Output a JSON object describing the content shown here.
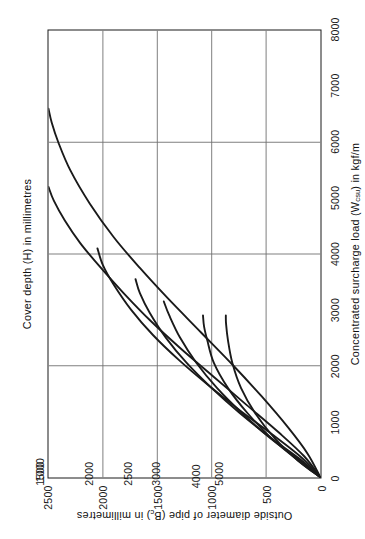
{
  "figure": {
    "caption": "Concentrated surcharge loading - fields, gardens and lightly trafficked access roads. Impact factor 2.0"
  },
  "chart_data": {
    "type": "line",
    "title": "Cover depth (H) in millimetres",
    "xlabel": "Concentrated surcharge load (Wcsu) in kgf/m",
    "xlabel_parts": {
      "pre": "Concentrated surcharge load (W",
      "sub": "csu",
      "post": ") in kgf/m"
    },
    "ylabel": "Outside diameter of pipe (Bc) in millimetres",
    "ylabel_parts": {
      "pre": "Outside diameter of pipe (B",
      "sub": "c",
      "post": ") in millimetres"
    },
    "xlim": [
      0,
      8000
    ],
    "ylim": [
      0,
      2500
    ],
    "xticks": [
      0,
      1000,
      2000,
      3000,
      4000,
      5000,
      6000,
      7000,
      8000
    ],
    "xticklabels": [
      "0",
      "1000",
      "2000",
      "3000",
      "4000",
      "5000",
      "6000",
      "7000",
      "8000"
    ],
    "yticks": [
      0,
      500,
      1000,
      1500,
      2000,
      2500
    ],
    "yticklabels": [
      "0",
      "500",
      "1000",
      "1500",
      "2000",
      "2500"
    ],
    "xgrid_lines": [
      2000,
      4000,
      6000,
      8000
    ],
    "ygrid_lines": [
      500,
      1000,
      1500,
      2000,
      2500
    ],
    "grid": true,
    "legend_position": "inline-curve-labels",
    "series": [
      {
        "name": "1000",
        "label": "1000",
        "label_x": 150,
        "label_y": 2500,
        "points": [
          [
            0,
            0
          ],
          [
            430,
            120
          ],
          [
            900,
            300
          ],
          [
            1450,
            540
          ],
          [
            2000,
            800
          ],
          [
            2600,
            1100
          ],
          [
            3200,
            1400
          ],
          [
            3750,
            1660
          ],
          [
            4300,
            1900
          ],
          [
            4900,
            2120
          ],
          [
            5500,
            2300
          ],
          [
            6000,
            2410
          ],
          [
            6350,
            2470
          ],
          [
            6600,
            2500
          ]
        ]
      },
      {
        "name": "1500",
        "label": "1500",
        "label_x": 85,
        "label_y": 2500,
        "points": [
          [
            0,
            0
          ],
          [
            380,
            150
          ],
          [
            800,
            380
          ],
          [
            1300,
            680
          ],
          [
            1800,
            980
          ],
          [
            2300,
            1280
          ],
          [
            2800,
            1560
          ],
          [
            3300,
            1810
          ],
          [
            3800,
            2040
          ],
          [
            4200,
            2210
          ],
          [
            4600,
            2350
          ],
          [
            4950,
            2450
          ],
          [
            5200,
            2500
          ]
        ]
      },
      {
        "name": "2000",
        "label": "2000",
        "label_x": 85,
        "label_y": 2050,
        "points": [
          [
            0,
            0
          ],
          [
            350,
            170
          ],
          [
            750,
            430
          ],
          [
            1200,
            740
          ],
          [
            1650,
            1030
          ],
          [
            2100,
            1300
          ],
          [
            2550,
            1540
          ],
          [
            3000,
            1740
          ],
          [
            3450,
            1900
          ],
          [
            3800,
            2000
          ],
          [
            4100,
            2050
          ]
        ]
      },
      {
        "name": "2500",
        "label": "2500",
        "label_x": 85,
        "label_y": 1700,
        "points": [
          [
            0,
            0
          ],
          [
            330,
            190
          ],
          [
            700,
            450
          ],
          [
            1150,
            740
          ],
          [
            1600,
            1000
          ],
          [
            2050,
            1230
          ],
          [
            2500,
            1420
          ],
          [
            2950,
            1570
          ],
          [
            3300,
            1660
          ],
          [
            3550,
            1700
          ]
        ]
      },
      {
        "name": "3000",
        "label": "3000",
        "label_x": 85,
        "label_y": 1440,
        "points": [
          [
            0,
            0
          ],
          [
            320,
            200
          ],
          [
            700,
            460
          ],
          [
            1150,
            720
          ],
          [
            1600,
            950
          ],
          [
            2050,
            1140
          ],
          [
            2500,
            1290
          ],
          [
            2900,
            1390
          ],
          [
            3150,
            1440
          ]
        ]
      },
      {
        "name": "4000",
        "label": "4000",
        "label_x": 40,
        "label_y": 1080,
        "points": [
          [
            0,
            0
          ],
          [
            310,
            210
          ],
          [
            700,
            450
          ],
          [
            1150,
            670
          ],
          [
            1600,
            850
          ],
          [
            2050,
            980
          ],
          [
            2450,
            1040
          ],
          [
            2700,
            1070
          ],
          [
            2900,
            1080
          ]
        ]
      },
      {
        "name": "5000",
        "label": "5000",
        "label_x": 85,
        "label_y": 870,
        "points": [
          [
            0,
            0
          ],
          [
            300,
            205
          ],
          [
            700,
            420
          ],
          [
            1150,
            600
          ],
          [
            1600,
            730
          ],
          [
            2050,
            810
          ],
          [
            2450,
            850
          ],
          [
            2750,
            868
          ],
          [
            2900,
            870
          ]
        ]
      }
    ]
  },
  "colors": {
    "frame": "#1a1a1a",
    "grid": "#707070",
    "curve": "#1a1a1a",
    "text": "#111111",
    "background": "#ffffff"
  }
}
